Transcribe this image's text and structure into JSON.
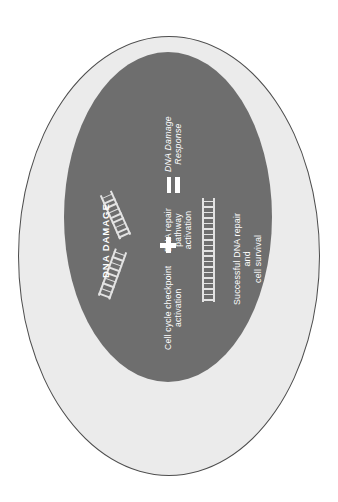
{
  "diagram": {
    "orientation": "rotated-90",
    "colors": {
      "background": "#ffffff",
      "cytoplasm": "#ebebeb",
      "cell_border": "#4d4d4d",
      "nucleus": "#6e6e6e",
      "label_text": "#ffffff",
      "dna_strand": "#e3e3e3"
    },
    "labels": {
      "damage": "DNA DAMAGE",
      "checkpoint": "Cell cycle checkpoint\nactivation",
      "repair": "DNA repair\npathway\nactivation",
      "response": "DNA Damage\nResponse",
      "outcome": "Successful DNA repair\nand\ncell survival"
    },
    "operators": {
      "plus": "+",
      "equals": "="
    },
    "dna_elements": [
      {
        "name": "broken-fragment-upper",
        "state": "broken",
        "rungs": 9
      },
      {
        "name": "broken-fragment-lower",
        "state": "broken",
        "rungs": 9
      },
      {
        "name": "intact-strand",
        "state": "repaired",
        "rungs": 19
      }
    ]
  }
}
